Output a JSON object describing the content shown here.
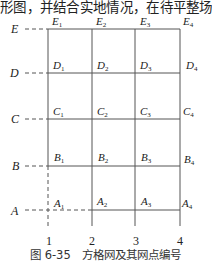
{
  "top_text": "形图，并结合实地情况，在待平整场",
  "caption": "图 6-35　方格网及其网点编号",
  "rows": [
    "E",
    "D",
    "C",
    "B",
    "A"
  ],
  "columns": [
    "1",
    "2",
    "3",
    "4"
  ],
  "points": {
    "E": [
      "E1",
      "E2",
      "E3",
      "E4"
    ],
    "D": [
      "D1",
      "D2",
      "D3",
      "D4"
    ],
    "C": [
      "C1",
      "C2",
      "C3",
      "C4"
    ],
    "B": [
      "B1",
      "B2",
      "B3",
      "B4"
    ],
    "A": [
      "A1",
      "A2",
      "A3",
      "A4"
    ]
  },
  "line_color": "#555555"
}
